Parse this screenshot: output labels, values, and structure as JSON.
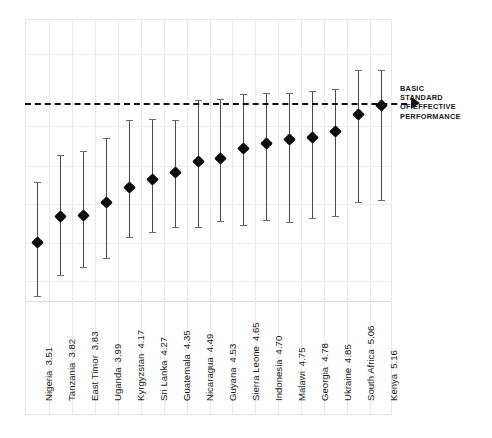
{
  "chart_data": {
    "type": "scatter",
    "title": "",
    "subtitle": "",
    "xlabel": "",
    "ylabel": "",
    "grid": true,
    "legend_position": "none",
    "ylim": [
      2.8,
      6.2
    ],
    "yticks": [
      6.2,
      5.9,
      5.3,
      4.95,
      4.65,
      4.3,
      3.95
    ],
    "reference_line": {
      "value": 5.0,
      "style": "dashed",
      "label": "BASIC STANDARD OF EFFECTIVE PERFORMANCE",
      "label_lines": [
        "BASIC",
        "STANDARD",
        "OF EFFECTIVE",
        "PERFORMANCE"
      ]
    },
    "categories": [
      "Nigeria",
      "Tanzania",
      "East Timor",
      "Uganda",
      "Kyrgyzstan",
      "Sri Lanka",
      "Guatemala",
      "Nicaragua",
      "Guyana",
      "Sierra Leone",
      "Indonesia",
      "Malawi",
      "Georgia",
      "Ukraine",
      "South Africa",
      "Kenya"
    ],
    "values": [
      3.51,
      3.82,
      3.83,
      3.99,
      4.17,
      4.27,
      4.35,
      4.49,
      4.53,
      4.65,
      4.7,
      4.75,
      4.78,
      4.85,
      5.06,
      5.16
    ],
    "value_labels": [
      "3.51",
      "3.82",
      "3.83",
      "3.99",
      "4.17",
      "4.27",
      "4.35",
      "4.49",
      "4.53",
      "4.65",
      "4.70",
      "4.75",
      "4.78",
      "4.85",
      "5.06",
      "5.16"
    ],
    "error_low": [
      2.86,
      3.12,
      3.21,
      3.32,
      3.58,
      3.63,
      3.69,
      3.7,
      3.77,
      3.72,
      3.78,
      3.76,
      3.8,
      3.83,
      4.0,
      4.02
    ],
    "error_high": [
      4.24,
      4.57,
      4.62,
      4.77,
      4.99,
      5.0,
      4.99,
      5.23,
      5.25,
      5.31,
      5.32,
      5.32,
      5.34,
      5.36,
      5.59,
      5.6
    ],
    "series": [
      {
        "name": "Country score with confidence interval",
        "values": [
          3.51,
          3.82,
          3.83,
          3.99,
          4.17,
          4.27,
          4.35,
          4.49,
          4.53,
          4.65,
          4.7,
          4.75,
          4.78,
          4.85,
          5.06,
          5.16
        ]
      }
    ],
    "marker_color": "#0d0d0d",
    "errorbar_color": "#6a6a6a",
    "grid_color": "#ededed",
    "reference_color": "#121212"
  },
  "annotation": {
    "line1": "BASIC",
    "line2": "STANDARD",
    "line3": "OF EFFECTIVE",
    "line4": "PERFORMANCE"
  }
}
